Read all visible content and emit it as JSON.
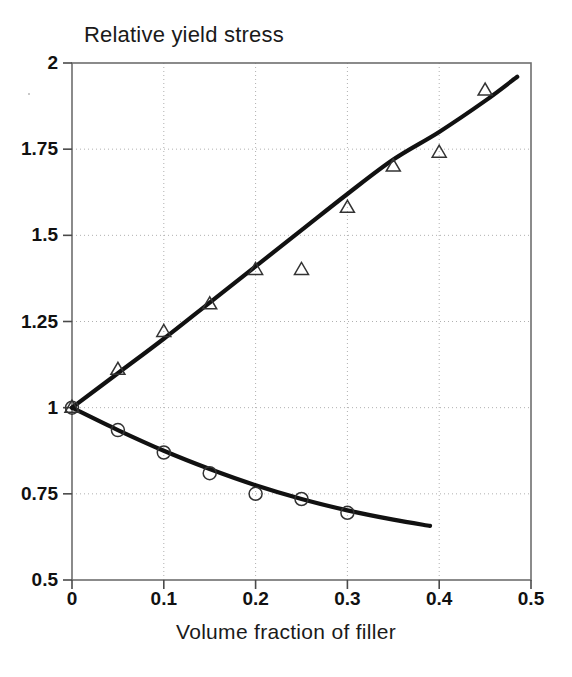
{
  "chart_data": {
    "type": "scatter",
    "title": "Relative yield stress",
    "xlabel": "Volume fraction of filler",
    "ylabel": "",
    "xlim": [
      0,
      0.5
    ],
    "ylim": [
      0.5,
      2
    ],
    "xticks": [
      "0",
      "0.1",
      "0.2",
      "0.3",
      "0.4",
      "0.5"
    ],
    "xtick_values": [
      0,
      0.1,
      0.2,
      0.3,
      0.4,
      0.5
    ],
    "yticks": [
      "0.5",
      "0.75",
      "1",
      "1.25",
      "1.5",
      "1.75",
      "2"
    ],
    "ytick_values": [
      0.5,
      0.75,
      1,
      1.25,
      1.5,
      1.75,
      2
    ],
    "grid": true,
    "grid_style": "dotted",
    "legend": "none",
    "series": [
      {
        "name": "upper-branch-markers",
        "marker": "triangle",
        "marker_filled": false,
        "mode": "markers",
        "x": [
          0,
          0.05,
          0.1,
          0.15,
          0.2,
          0.25,
          0.3,
          0.35,
          0.4,
          0.45
        ],
        "y": [
          1.0,
          1.11,
          1.22,
          1.3,
          1.4,
          1.4,
          1.58,
          1.7,
          1.74,
          1.92
        ]
      },
      {
        "name": "lower-branch-markers",
        "marker": "circle",
        "marker_filled": false,
        "mode": "markers",
        "x": [
          0,
          0.05,
          0.1,
          0.15,
          0.2,
          0.25,
          0.3
        ],
        "y": [
          1.0,
          0.935,
          0.87,
          0.81,
          0.75,
          0.735,
          0.695
        ]
      },
      {
        "name": "upper-branch-fit-curve",
        "marker": "none",
        "mode": "lines",
        "x": [
          0,
          0.05,
          0.1,
          0.15,
          0.2,
          0.25,
          0.3,
          0.35,
          0.4,
          0.45,
          0.485
        ],
        "y": [
          1.0,
          1.1,
          1.2,
          1.305,
          1.41,
          1.515,
          1.62,
          1.72,
          1.8,
          1.89,
          1.96
        ]
      },
      {
        "name": "lower-branch-fit-curve",
        "marker": "none",
        "mode": "lines",
        "x": [
          0,
          0.05,
          0.1,
          0.15,
          0.2,
          0.25,
          0.3,
          0.35,
          0.39
        ],
        "y": [
          1.0,
          0.935,
          0.875,
          0.822,
          0.775,
          0.735,
          0.702,
          0.675,
          0.657
        ]
      }
    ]
  }
}
